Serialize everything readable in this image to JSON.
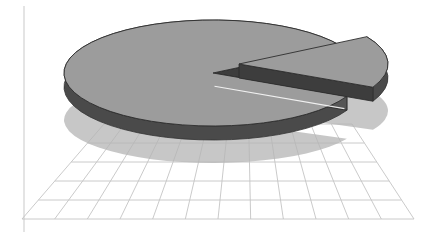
{
  "canvas": {
    "width": 425,
    "height": 236,
    "background": "#ffffff",
    "name": "3D Exploded Pie Chart"
  },
  "palette": {
    "pie_top": "#9c9c9c",
    "pie_side": "#4a4a4a",
    "pie_cut_wall": "#3d3d3d",
    "pie_outline": "#2e2e2e",
    "shadow_fill": "#b5b5b5",
    "grid_line": "#c4c4c4",
    "axis_line": "#c9c9c9",
    "background": "#ffffff",
    "highlight": "#ffffff"
  },
  "chart_data": {
    "type": "pie",
    "title": "",
    "subtitle": "",
    "xlabel": "",
    "ylabel": "",
    "legend_position": "none",
    "grid": true,
    "three_d": true,
    "depth_px": 14,
    "explode_slice_index": 1,
    "categories": [
      "Series 1",
      "Series 2"
    ],
    "values": [
      75,
      25
    ],
    "percentages": [
      "75%",
      "25%"
    ],
    "start_angle_deg": 330,
    "slice_colors": [
      "#9c9c9c",
      "#9c9c9c"
    ],
    "data_labels_visible": false,
    "tick_labels": [],
    "annotations": []
  },
  "floor_grid": {
    "name": "perspective-floor-grid",
    "columns": 12,
    "rows": 5,
    "line_color": "#c4c4c4",
    "line_width": 0.9,
    "near_left": [
      22,
      219
    ],
    "near_right": [
      414,
      219
    ],
    "far_left": [
      104,
      124
    ],
    "far_right": [
      352,
      124
    ]
  },
  "axis": {
    "vertical_rule_x": 24,
    "vertical_rule_color": "#c9c9c9",
    "visible": true
  },
  "shadow": {
    "name": "pie-ground-shadow",
    "center": [
      213,
      120
    ],
    "rx": 149,
    "ry": 43,
    "fill": "#b5b5b5",
    "opacity": 0.75
  },
  "main_pie": {
    "name": "main-pie-body",
    "center": [
      213,
      73
    ],
    "rx": 149,
    "ry": 53,
    "depth": 14,
    "cut_start_angle_deg": -31,
    "cut_end_angle_deg": 26
  },
  "exploded_slice": {
    "name": "exploded-pie-slice",
    "offset": [
      26,
      -9
    ],
    "start_angle_deg": -31,
    "end_angle_deg": 26,
    "depth": 14
  }
}
